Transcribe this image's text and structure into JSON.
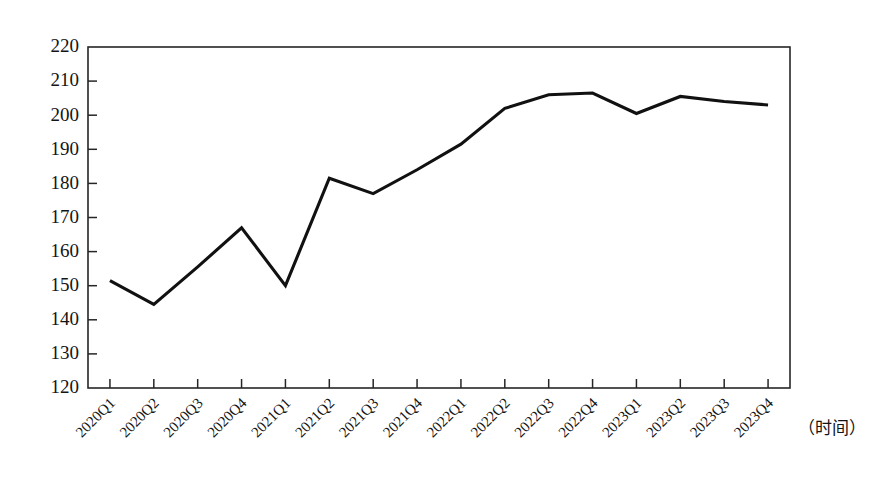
{
  "chart_data": {
    "type": "line",
    "title": "",
    "subtitle": "",
    "xlabel": "（时间）",
    "ylabel": "",
    "grid": false,
    "legend": "none",
    "xlim_categories": 16,
    "ylim": [
      120,
      220
    ],
    "y_ticks": [
      120,
      130,
      140,
      150,
      160,
      170,
      180,
      190,
      200,
      210,
      220
    ],
    "categories": [
      "2020Q1",
      "2020Q2",
      "2020Q3",
      "2020Q4",
      "2021Q1",
      "2021Q2",
      "2021Q3",
      "2021Q4",
      "2022Q1",
      "2022Q2",
      "2022Q3",
      "2022Q4",
      "2023Q1",
      "2023Q2",
      "2023Q3",
      "2023Q4"
    ],
    "series": [
      {
        "name": "",
        "color": "#111111",
        "values": [
          151.5,
          144.5,
          155.5,
          167.0,
          150.0,
          181.5,
          177.0,
          184.0,
          191.5,
          202.0,
          206.0,
          206.5,
          200.5,
          205.5,
          204.0,
          203.0
        ]
      }
    ]
  },
  "axis": {
    "x_label_text": "（时间）",
    "y_tick_texts": [
      "220",
      "210",
      "200",
      "190",
      "180",
      "170",
      "160",
      "150",
      "140",
      "130",
      "120"
    ],
    "x_tick_texts": [
      "2020Q1",
      "2020Q2",
      "2020Q3",
      "2020Q4",
      "2021Q1",
      "2021Q2",
      "2021Q3",
      "2021Q4",
      "2022Q1",
      "2022Q2",
      "2022Q3",
      "2022Q4",
      "2023Q1",
      "2023Q2",
      "2023Q3",
      "2023Q4"
    ]
  },
  "colors": {
    "line": "#111111",
    "axis": "#262626",
    "text": "#141414",
    "background": "#ffffff"
  }
}
